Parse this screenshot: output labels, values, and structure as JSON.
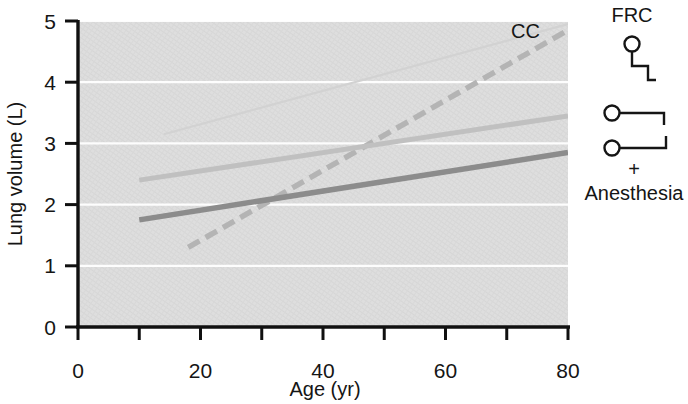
{
  "figure": {
    "background_color": "#ffffff",
    "plot_background_color": "#dcdcdc",
    "gridline_color": "#ffffff",
    "axis_color": "#101010"
  },
  "axes": {
    "x": {
      "title": "Age (yr)",
      "min": 0,
      "max": 80,
      "tick_values": [
        0,
        10,
        20,
        30,
        40,
        50,
        60,
        70,
        80
      ],
      "tick_labels": [
        "0",
        "",
        "20",
        "",
        "40",
        "",
        "60",
        "",
        "80"
      ]
    },
    "y": {
      "title": "Lung volume (L)",
      "min": 0,
      "max": 5,
      "tick_values": [
        0,
        1,
        2,
        3,
        4,
        5
      ],
      "tick_labels": [
        "0",
        "1",
        "2",
        "3",
        "4",
        "5"
      ]
    }
  },
  "annotations": {
    "cc_label": "CC"
  },
  "legend": {
    "title": "FRC",
    "footer_plus": "+",
    "footer_label": "Anesthesia",
    "marker_color": "#151515"
  },
  "chart_data": {
    "type": "line",
    "title": "",
    "xlabel": "Age (yr)",
    "ylabel": "Lung volume (L)",
    "xlim": [
      0,
      80
    ],
    "ylim": [
      0,
      5
    ],
    "grid": true,
    "grid_axis": "y",
    "legend_position": "right",
    "series": [
      {
        "name": "TLC",
        "label": "",
        "style": "solid",
        "color": "#d2d2d2",
        "width": 2.2,
        "x": [
          14,
          80
        ],
        "y": [
          3.15,
          4.95
        ]
      },
      {
        "name": "CC",
        "label": "CC",
        "style": "dashed",
        "color": "#b4b4b4",
        "width": 5.5,
        "x": [
          18,
          80
        ],
        "y": [
          1.3,
          4.85
        ]
      },
      {
        "name": "FRC",
        "label": "FRC",
        "style": "solid",
        "color": "#c0c0c0",
        "width": 5.0,
        "x": [
          10,
          80
        ],
        "y": [
          2.4,
          3.45
        ]
      },
      {
        "name": "FRC + Anesthesia",
        "label": "FRC + Anesthesia",
        "style": "solid",
        "color": "#8c8c8c",
        "width": 5.5,
        "x": [
          10,
          80
        ],
        "y": [
          1.75,
          2.85
        ]
      }
    ]
  }
}
